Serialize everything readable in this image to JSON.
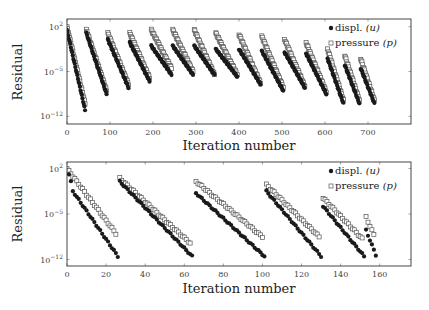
{
  "chart_data": [
    {
      "type": "scatter",
      "title": "",
      "xlabel": "Iteration number",
      "ylabel": "Residual",
      "yscale": "log",
      "xlim": [
        0,
        800
      ],
      "ylim_log10": [
        -13.2,
        3.2
      ],
      "xticks": [
        0,
        100,
        200,
        300,
        400,
        500,
        600,
        700
      ],
      "yticks": [
        {
          "value_log10": 2,
          "label": "10",
          "exp": "2"
        },
        {
          "value_log10": -5,
          "label": "10",
          "exp": "−5"
        },
        {
          "value_log10": -12,
          "label": "10",
          "exp": "−12"
        }
      ],
      "legend": {
        "position": "upper right",
        "entries": [
          {
            "label": "displ. ",
            "math": "(u)",
            "marker": "filled-circle"
          },
          {
            "label": "pressure ",
            "math": "(p)",
            "marker": "open-square"
          }
        ]
      },
      "grid": false,
      "series": [
        {
          "name": "displ. (u)",
          "marker": "filled-circle",
          "segments": [
            {
              "x0": 0,
              "x1": 42,
              "y0": 1.5,
              "y1": -11.0
            },
            {
              "x0": 45,
              "x1": 92,
              "y0": 1.0,
              "y1": -8.5
            },
            {
              "x0": 95,
              "x1": 143,
              "y0": 0.0,
              "y1": -7.5
            },
            {
              "x0": 146,
              "x1": 192,
              "y0": -0.5,
              "y1": -6.5
            },
            {
              "x0": 196,
              "x1": 243,
              "y0": -1.0,
              "y1": -5.5
            },
            {
              "x0": 246,
              "x1": 293,
              "y0": -1.0,
              "y1": -5.5
            },
            {
              "x0": 296,
              "x1": 343,
              "y0": -1.0,
              "y1": -5.5
            },
            {
              "x0": 346,
              "x1": 396,
              "y0": -1.5,
              "y1": -5.8
            },
            {
              "x0": 400,
              "x1": 450,
              "y0": -1.5,
              "y1": -7.0
            },
            {
              "x0": 453,
              "x1": 503,
              "y0": -1.8,
              "y1": -8.0
            },
            {
              "x0": 506,
              "x1": 553,
              "y0": -2.0,
              "y1": -7.5
            },
            {
              "x0": 556,
              "x1": 603,
              "y0": -2.2,
              "y1": -8.5
            },
            {
              "x0": 606,
              "x1": 643,
              "y0": -3.0,
              "y1": -10.0
            },
            {
              "x0": 646,
              "x1": 680,
              "y0": -4.0,
              "y1": -10.0
            },
            {
              "x0": 683,
              "x1": 715,
              "y0": -4.5,
              "y1": -10.0
            }
          ]
        },
        {
          "name": "pressure (p)",
          "marker": "open-square",
          "segments": [
            {
              "x0": 0,
              "x1": 42,
              "y0": 2.0,
              "y1": -10.0
            },
            {
              "x0": 45,
              "x1": 92,
              "y0": 1.5,
              "y1": -8.0
            },
            {
              "x0": 95,
              "x1": 143,
              "y0": 1.0,
              "y1": -7.0
            },
            {
              "x0": 146,
              "x1": 192,
              "y0": 1.0,
              "y1": -6.0
            },
            {
              "x0": 196,
              "x1": 243,
              "y0": 1.5,
              "y1": -4.5
            },
            {
              "x0": 246,
              "x1": 293,
              "y0": 1.5,
              "y1": -5.0
            },
            {
              "x0": 296,
              "x1": 343,
              "y0": 1.5,
              "y1": -5.5
            },
            {
              "x0": 346,
              "x1": 396,
              "y0": 1.0,
              "y1": -5.5
            },
            {
              "x0": 400,
              "x1": 450,
              "y0": 0.8,
              "y1": -6.8
            },
            {
              "x0": 453,
              "x1": 503,
              "y0": 0.5,
              "y1": -7.5
            },
            {
              "x0": 506,
              "x1": 553,
              "y0": 0.0,
              "y1": -7.3
            },
            {
              "x0": 556,
              "x1": 603,
              "y0": -0.5,
              "y1": -8.2
            },
            {
              "x0": 606,
              "x1": 643,
              "y0": -1.5,
              "y1": -9.5
            },
            {
              "x0": 646,
              "x1": 680,
              "y0": -2.5,
              "y1": -9.5
            },
            {
              "x0": 683,
              "x1": 715,
              "y0": -3.0,
              "y1": -9.5
            }
          ]
        }
      ]
    },
    {
      "type": "scatter",
      "title": "",
      "xlabel": "Iteration number",
      "ylabel": "Residual",
      "yscale": "log",
      "xlim": [
        0,
        176
      ],
      "ylim_log10": [
        -13.0,
        3.0
      ],
      "xticks": [
        0,
        20,
        40,
        60,
        80,
        100,
        120,
        140,
        160
      ],
      "yticks": [
        {
          "value_log10": 2,
          "label": "10",
          "exp": "2"
        },
        {
          "value_log10": -5,
          "label": "10",
          "exp": "−5"
        },
        {
          "value_log10": -12,
          "label": "10",
          "exp": "−12"
        }
      ],
      "legend": {
        "position": "upper right",
        "entries": [
          {
            "label": "displ. ",
            "math": "(u)",
            "marker": "filled-circle"
          },
          {
            "label": "pressure ",
            "math": "(p)",
            "marker": "open-square"
          }
        ]
      },
      "grid": false,
      "series": [
        {
          "name": "displ. (u)",
          "marker": "filled-circle",
          "segments": [
            {
              "x0": 1,
              "x1": 2,
              "y0": 1.0,
              "y1": 0.0,
              "step": 1
            },
            {
              "x0": 3,
              "x1": 26,
              "y0": -1.5,
              "y1": -11.5
            },
            {
              "x0": 27,
              "x1": 64,
              "y0": 0.0,
              "y1": -11.5
            },
            {
              "x0": 66,
              "x1": 101,
              "y0": -1.8,
              "y1": -11.5
            },
            {
              "x0": 102,
              "x1": 130,
              "y0": -1.5,
              "y1": -11.5
            },
            {
              "x0": 131,
              "x1": 152,
              "y0": -3.8,
              "y1": -11.5
            },
            {
              "x0": 153,
              "x1": 158,
              "y0": -7.5,
              "y1": -11.3
            }
          ]
        },
        {
          "name": "pressure (p)",
          "marker": "open-square",
          "segments": [
            {
              "x0": 0,
              "x1": 25,
              "y0": 2.0,
              "y1": -8.0
            },
            {
              "x0": 27,
              "x1": 63,
              "y0": 0.5,
              "y1": -9.5
            },
            {
              "x0": 66,
              "x1": 100,
              "y0": 0.0,
              "y1": -8.5
            },
            {
              "x0": 102,
              "x1": 129,
              "y0": -0.5,
              "y1": -8.5
            },
            {
              "x0": 131,
              "x1": 151,
              "y0": -2.5,
              "y1": -8.8
            },
            {
              "x0": 153,
              "x1": 157,
              "y0": -5.5,
              "y1": -8.2
            }
          ]
        }
      ]
    }
  ],
  "figure": {
    "panels": [
      {
        "ylabel": "Residual",
        "xlabel": "Iteration number"
      },
      {
        "ylabel": "Residual",
        "xlabel": "Iteration number"
      }
    ]
  },
  "colors": {
    "displacement_marker": "#1a1a1a",
    "pressure_marker_stroke": "#555555",
    "axis": "#333333"
  }
}
